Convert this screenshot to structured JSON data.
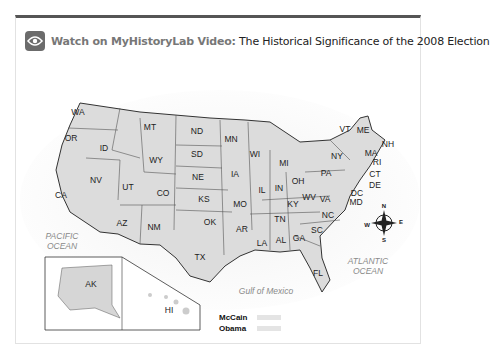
{
  "header": {
    "icon": "eye-icon",
    "brand_label": "Watch on MyHistoryLab Video:",
    "title": "The Historical Significance of the 2008 Election"
  },
  "map": {
    "title": "2008 U.S. Presidential Election by State",
    "states": [
      {
        "abbr": "WA",
        "x": 78,
        "y": 112
      },
      {
        "abbr": "OR",
        "x": 71,
        "y": 138
      },
      {
        "abbr": "ID",
        "x": 104,
        "y": 148
      },
      {
        "abbr": "MT",
        "x": 150,
        "y": 127
      },
      {
        "abbr": "WY",
        "x": 156,
        "y": 160
      },
      {
        "abbr": "ND",
        "x": 197,
        "y": 131
      },
      {
        "abbr": "SD",
        "x": 197,
        "y": 154
      },
      {
        "abbr": "NE",
        "x": 198,
        "y": 177
      },
      {
        "abbr": "NV",
        "x": 96,
        "y": 180
      },
      {
        "abbr": "UT",
        "x": 128,
        "y": 187
      },
      {
        "abbr": "CO",
        "x": 163,
        "y": 193
      },
      {
        "abbr": "KS",
        "x": 204,
        "y": 199
      },
      {
        "abbr": "CA",
        "x": 61,
        "y": 195
      },
      {
        "abbr": "AZ",
        "x": 122,
        "y": 223
      },
      {
        "abbr": "NM",
        "x": 154,
        "y": 227
      },
      {
        "abbr": "OK",
        "x": 210,
        "y": 222
      },
      {
        "abbr": "TX",
        "x": 200,
        "y": 257
      },
      {
        "abbr": "MN",
        "x": 231,
        "y": 139
      },
      {
        "abbr": "IA",
        "x": 235,
        "y": 174
      },
      {
        "abbr": "MO",
        "x": 240,
        "y": 204
      },
      {
        "abbr": "AR",
        "x": 242,
        "y": 229
      },
      {
        "abbr": "LA",
        "x": 262,
        "y": 243
      },
      {
        "abbr": "WI",
        "x": 255,
        "y": 154
      },
      {
        "abbr": "IL",
        "x": 262,
        "y": 190
      },
      {
        "abbr": "MI",
        "x": 284,
        "y": 163
      },
      {
        "abbr": "IN",
        "x": 279,
        "y": 188
      },
      {
        "abbr": "OH",
        "x": 298,
        "y": 181
      },
      {
        "abbr": "KY",
        "x": 293,
        "y": 204
      },
      {
        "abbr": "TN",
        "x": 280,
        "y": 219
      },
      {
        "abbr": "AL",
        "x": 281,
        "y": 240
      },
      {
        "abbr": "GA",
        "x": 299,
        "y": 238
      },
      {
        "abbr": "FL",
        "x": 318,
        "y": 273
      },
      {
        "abbr": "SC",
        "x": 317,
        "y": 230
      },
      {
        "abbr": "NC",
        "x": 328,
        "y": 215
      },
      {
        "abbr": "VA",
        "x": 325,
        "y": 199
      },
      {
        "abbr": "WV",
        "x": 309,
        "y": 197
      },
      {
        "abbr": "PA",
        "x": 326,
        "y": 173
      },
      {
        "abbr": "NY",
        "x": 337,
        "y": 156
      },
      {
        "abbr": "VT",
        "x": 345,
        "y": 129
      },
      {
        "abbr": "ME",
        "x": 363,
        "y": 130
      },
      {
        "abbr": "NH",
        "x": 388,
        "y": 144
      },
      {
        "abbr": "MA",
        "x": 371,
        "y": 153
      },
      {
        "abbr": "RI",
        "x": 377,
        "y": 162
      },
      {
        "abbr": "CT",
        "x": 375,
        "y": 174
      },
      {
        "abbr": "DE",
        "x": 375,
        "y": 185
      },
      {
        "abbr": "DC",
        "x": 357,
        "y": 193
      },
      {
        "abbr": "MD",
        "x": 356,
        "y": 202
      },
      {
        "abbr": "AK",
        "x": 91,
        "y": 284
      },
      {
        "abbr": "HI",
        "x": 169,
        "y": 310
      }
    ],
    "oceans": [
      {
        "name": "PACIFIC\nOCEAN",
        "x": 62,
        "y": 241
      },
      {
        "name": "ATLANTIC\nOCEAN",
        "x": 368,
        "y": 266
      },
      {
        "name": "Gulf of Mexico",
        "x": 266,
        "y": 291
      }
    ],
    "compass": {
      "n": "N",
      "s": "S",
      "e": "E",
      "w": "W"
    }
  },
  "legend": {
    "items": [
      {
        "label": "McCain",
        "color": "#e4e4e4"
      },
      {
        "label": "Obama",
        "color": "#e4e4e4"
      }
    ]
  },
  "colors": {
    "frame_top": "#555555",
    "icon_bg": "#6b6b6b",
    "brand": "#777777",
    "state_fill": "#d9d9d9",
    "state_stroke": "#333333"
  }
}
